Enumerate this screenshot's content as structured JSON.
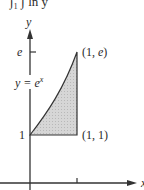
{
  "header_fragment": {
    "text": "∫₁ ∫ ln y",
    "note_visible": "cropped integral-limits text at top edge"
  },
  "axes": {
    "y_label": "y",
    "x_label": "x",
    "y_ticks": [
      {
        "label": "e",
        "value": 2.718
      },
      {
        "label": "1",
        "value": 1
      }
    ],
    "x_ticks": [
      {
        "label": "",
        "value": 1
      }
    ]
  },
  "curve": {
    "label_lhs": "y = e",
    "label_exp": "x"
  },
  "points": [
    {
      "label": "(1, e)",
      "x": 1,
      "y": 2.718
    },
    {
      "label": "(1, 1)",
      "x": 1,
      "y": 1
    }
  ],
  "region": {
    "fill": "#cfcfcf",
    "stroke": "#333333",
    "description": "shaded region bounded by y=e^x, x=1, and y=1"
  },
  "colors": {
    "axis": "#333333",
    "text": "#2a2a2a",
    "background": "#ffffff"
  }
}
